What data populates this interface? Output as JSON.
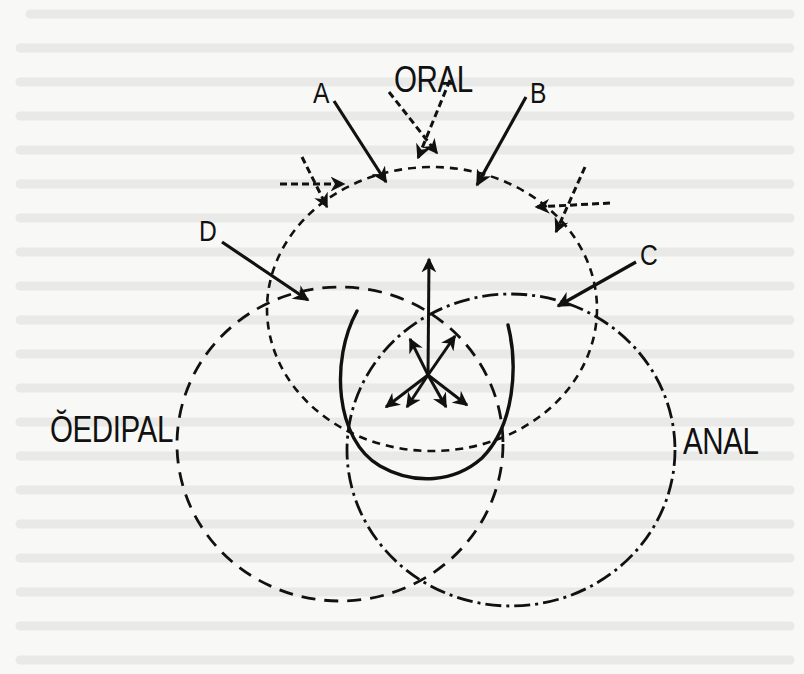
{
  "diagram": {
    "regions": [
      {
        "id": "oral",
        "label": "ORAL",
        "line_style": "short-dash"
      },
      {
        "id": "oedipal",
        "label": "ŎEDIPAL",
        "line_style": "long-dash"
      },
      {
        "id": "anal",
        "label": "ANAL",
        "line_style": "dash-dot"
      }
    ],
    "external_arrows": [
      {
        "label": "A",
        "style": "solid"
      },
      {
        "label": "B",
        "style": "solid"
      },
      {
        "label": "C",
        "style": "solid"
      },
      {
        "label": "D",
        "style": "solid"
      }
    ],
    "dashed_arrow_clusters": 3,
    "central_burst_arrows": 7,
    "colors": {
      "ink": "#111111",
      "paper": "#f8f8f6",
      "show_through": "#e2e2df"
    }
  }
}
